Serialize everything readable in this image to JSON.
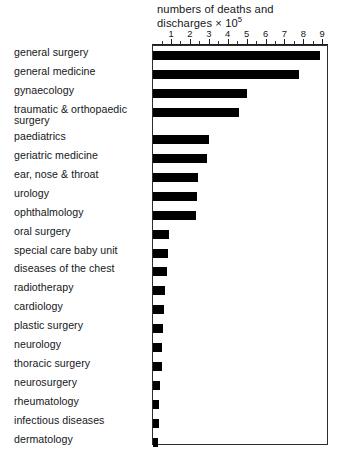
{
  "chart_data": {
    "type": "bar",
    "orientation": "horizontal",
    "title_line1": "numbers  of deaths and",
    "title_line2_prefix": "discharges × 10",
    "title_line2_exponent": "5",
    "xlabel": "numbers of deaths and discharges × 10^5",
    "ylabel": "",
    "xlim": [
      0,
      9.3
    ],
    "xticks": [
      1,
      2,
      3,
      4,
      5,
      6,
      7,
      8,
      9
    ],
    "xtick_labels": [
      "1",
      "2",
      "3",
      "4",
      "5",
      "6",
      "7",
      "8",
      "9"
    ],
    "minor_ticks_between": 1,
    "grid": false,
    "legend": "none",
    "bar_color": "#000000",
    "frame_color": "#2a2d31",
    "categories": [
      "general surgery",
      "general medicine",
      "gynaecology",
      "traumatic & orthopaedic surgery",
      "paediatrics",
      "geriatric medicine",
      "ear, nose & throat",
      "urology",
      "ophthalmology",
      "oral surgery",
      "special care baby unit",
      "diseases of the chest",
      "radiotherapy",
      "cardiology",
      "plastic surgery",
      "neurology",
      "thoracic surgery",
      "neurosurgery",
      "rheumatology",
      "infectious diseases",
      "dermatology"
    ],
    "values": [
      8.85,
      7.75,
      4.95,
      4.55,
      2.95,
      2.85,
      2.4,
      2.35,
      2.25,
      0.85,
      0.8,
      0.75,
      0.65,
      0.6,
      0.55,
      0.45,
      0.45,
      0.35,
      0.3,
      0.3,
      0.25
    ],
    "units": "10^5 deaths and discharges"
  },
  "rows": [
    {
      "label": "general surgery",
      "label2": "",
      "value": 8.85
    },
    {
      "label": "general medicine",
      "label2": "",
      "value": 7.75
    },
    {
      "label": "gynaecology",
      "label2": "",
      "value": 4.95
    },
    {
      "label": "traumatic & orthopaedic",
      "label2": "surgery",
      "value": 4.55
    },
    {
      "label": "paediatrics",
      "label2": "",
      "value": 2.95
    },
    {
      "label": "geriatric medicine",
      "label2": "",
      "value": 2.85
    },
    {
      "label": "ear, nose & throat",
      "label2": "",
      "value": 2.4
    },
    {
      "label": "urology",
      "label2": "",
      "value": 2.35
    },
    {
      "label": "ophthalmology",
      "label2": "",
      "value": 2.25
    },
    {
      "label": "oral surgery",
      "label2": "",
      "value": 0.85
    },
    {
      "label": "special care baby unit",
      "label2": "",
      "value": 0.8
    },
    {
      "label": "diseases of the chest",
      "label2": "",
      "value": 0.75
    },
    {
      "label": "radiotherapy",
      "label2": "",
      "value": 0.65
    },
    {
      "label": "cardiology",
      "label2": "",
      "value": 0.6
    },
    {
      "label": "plastic surgery",
      "label2": "",
      "value": 0.55
    },
    {
      "label": "neurology",
      "label2": "",
      "value": 0.45
    },
    {
      "label": "thoracic surgery",
      "label2": "",
      "value": 0.45
    },
    {
      "label": "neurosurgery",
      "label2": "",
      "value": 0.35
    },
    {
      "label": "rheumatology",
      "label2": "",
      "value": 0.3
    },
    {
      "label": "infectious diseases",
      "label2": "",
      "value": 0.3
    },
    {
      "label": "dermatology",
      "label2": "",
      "value": 0.25
    }
  ]
}
